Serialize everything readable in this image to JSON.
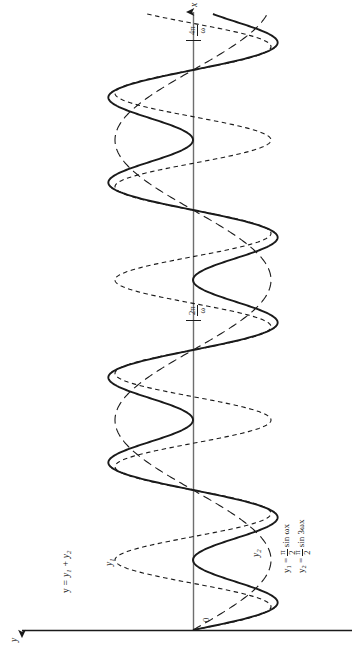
{
  "figure": {
    "orientation": "rotated-90-ccw",
    "background_color": "#ffffff",
    "ink_color": "#1a1a1a"
  },
  "axes": {
    "x_axis": {
      "label": "x",
      "arrow": "up",
      "origin_label": "0",
      "ticks": [
        {
          "value": "2pi/omega",
          "num": "2π",
          "den": "ω",
          "position_px": 320
        },
        {
          "value": "4pi/omega",
          "num": "4π",
          "den": "ω",
          "position_px": 40
        }
      ]
    },
    "y_axis": {
      "label": "y",
      "arrow": "left"
    }
  },
  "curve_labels": {
    "sum": "y = y₁ + y₂",
    "sum_plain": "y = y1 + y2",
    "fundamental": "y₁",
    "harmonic": "y₂"
  },
  "equations": [
    {
      "lhs": "y₁",
      "eq": "=",
      "coef_num": "π",
      "coef_den": "2",
      "rhs": "sin ωx",
      "plain": "y1 = (pi/2) sin wx"
    },
    {
      "lhs": "y₂",
      "eq": "=",
      "coef_num": "π",
      "coef_den": "2",
      "rhs": "sin 3ωx",
      "plain": "y2 = (pi/2) sin 3wx"
    }
  ],
  "chart_data": {
    "type": "line",
    "title": "",
    "xlabel": "x",
    "ylabel": "y",
    "grid": false,
    "legend": "inline-annotations",
    "note": "Figure is drawn rotated 90 degrees: the x-axis runs vertically up the page, the y-axis runs horizontally to the left.",
    "x": {
      "unit": "1/omega",
      "range": [
        0,
        14.2
      ],
      "ticks": [
        0,
        6.283185307,
        12.56637061
      ],
      "tick_labels": [
        "0",
        "2π/ω",
        "4π/ω"
      ]
    },
    "y": {
      "range": [
        -2.4,
        2.4
      ],
      "amplitude_each": 1.5707963,
      "amplitude_label": "π/2"
    },
    "series": [
      {
        "name": "y1",
        "label": "y₁",
        "formula": "y1 = (pi/2) * sin(w*x)",
        "amplitude": 1.5707963,
        "frequency_multiplier": 1,
        "style": "long-dashed",
        "dash_pattern": "9,5",
        "stroke_width": 1.1,
        "color": "#1a1a1a"
      },
      {
        "name": "y2",
        "label": "y₂",
        "formula": "y2 = (pi/2) * sin(3*w*x)",
        "amplitude": 1.5707963,
        "frequency_multiplier": 3,
        "style": "short-dashed",
        "dash_pattern": "4.5,3.5",
        "stroke_width": 1.1,
        "color": "#1a1a1a"
      },
      {
        "name": "y",
        "label": "y = y₁ + y₂",
        "formula": "y = (pi/2)*sin(w*x) + (pi/2)*sin(3*w*x)",
        "style": "solid",
        "dash_pattern": "none",
        "stroke_width": 1.9,
        "color": "#1a1a1a"
      }
    ]
  },
  "geometry": {
    "x_axis_px": 193,
    "y_axis_px": 630,
    "origin": [
      193,
      630
    ],
    "x_axis_top_px": 8,
    "y_axis_left_px": 18,
    "y_axis_right_px": 352,
    "period_px": 280,
    "amplitude_px": 78
  }
}
